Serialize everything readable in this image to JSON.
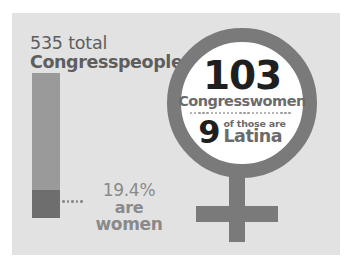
{
  "chart_data": {
    "type": "bar",
    "title": "535 total Congresspeople",
    "categories": [
      "Congresspeople"
    ],
    "series": [
      {
        "name": "Total Congresspeople",
        "values": [
          535
        ]
      },
      {
        "name": "Congresswomen",
        "values": [
          103
        ]
      },
      {
        "name": "Latina Congresswomen",
        "values": [
          9
        ]
      }
    ],
    "percent_women": 19.4,
    "xlabel": "",
    "ylabel": "",
    "ylim": [
      0,
      535
    ],
    "grid": false,
    "legend": "none",
    "annotations": [
      "535 total Congresspeople",
      "19.4% are women",
      "103 Congresswomen",
      "9 of those are Latina"
    ]
  },
  "colors": {
    "background": "#ffffff",
    "panel": "#e2e2e2",
    "bar_total": "#9a9a9a",
    "bar_women": "#6e6e6e",
    "symbol": "#7a7a7a",
    "heading_text": "#5e5e5e",
    "accent_text": "#8a8a8a",
    "dark_number": "#1f1f1f",
    "muted_text": "#6b6b6b",
    "circle_fill": "#ffffff"
  },
  "left": {
    "heading_line1": "535 total",
    "heading_line2": "Congresspeople",
    "percent": "19.4%",
    "are": "are",
    "women": "women"
  },
  "venus": {
    "icon": "venus-symbol",
    "count": "103",
    "count_label": "Congresswomen",
    "latina_count": "9",
    "latina_prefix": "of those are",
    "latina_label": "Latina"
  }
}
